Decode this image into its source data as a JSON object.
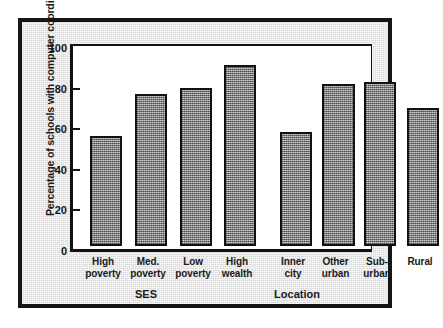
{
  "chart_data": {
    "type": "bar",
    "title": "",
    "xlabel": "",
    "ylabel": "Percentage of schools with computer coordinators",
    "ylim": [
      0,
      100
    ],
    "yticks": [
      0,
      20,
      40,
      60,
      80,
      100
    ],
    "ytick_labels": [
      "0",
      "20",
      "40",
      "60",
      "80",
      "100"
    ],
    "grid": false,
    "legend": false,
    "group_labels": [
      "SES",
      "Location"
    ],
    "categories": [
      "High poverty",
      "Med. poverty",
      "Low poverty",
      "High wealth",
      "Inner city",
      "Other urban",
      "Sub-urban",
      "Rural"
    ],
    "category_lines": [
      [
        "High",
        "poverty"
      ],
      [
        "Med.",
        "poverty"
      ],
      [
        "Low",
        "poverty"
      ],
      [
        "High",
        "wealth"
      ],
      [
        "Inner",
        "city"
      ],
      [
        "Other",
        "urban"
      ],
      [
        "Sub-",
        "urban"
      ],
      [
        "Rural",
        ""
      ]
    ],
    "values": [
      54,
      75,
      78,
      89,
      56,
      80,
      81,
      68
    ],
    "groups": [
      {
        "name": "SES",
        "categories": [
          "High poverty",
          "Med. poverty",
          "Low poverty",
          "High wealth"
        ],
        "values": [
          54,
          75,
          78,
          89
        ]
      },
      {
        "name": "Location",
        "categories": [
          "Inner city",
          "Other urban",
          "Sub-urban",
          "Rural"
        ],
        "values": [
          56,
          80,
          81,
          68
        ]
      }
    ],
    "colors": {
      "bar_fill": "#9a9a9a",
      "bar_edge": "#121212",
      "plot_background": "#ffffff",
      "figure_background": "#d9d9d9",
      "frame": "#151515",
      "text": "#1a1a1a"
    }
  },
  "axis": {
    "y_title": "Percentage of schools with computer coordinators",
    "ticks": [
      {
        "label": "100",
        "value": 100
      },
      {
        "label": "80",
        "value": 80
      },
      {
        "label": "60",
        "value": 60
      },
      {
        "label": "40",
        "value": 40
      },
      {
        "label": "20",
        "value": 20
      },
      {
        "label": "0",
        "value": 0
      }
    ]
  },
  "bars": [
    {
      "name": "high-poverty",
      "line1": "High",
      "line2": "poverty",
      "value": 54
    },
    {
      "name": "med-poverty",
      "line1": "Med.",
      "line2": "poverty",
      "value": 75
    },
    {
      "name": "low-poverty",
      "line1": "Low",
      "line2": "poverty",
      "value": 78
    },
    {
      "name": "high-wealth",
      "line1": "High",
      "line2": "wealth",
      "value": 89
    },
    {
      "name": "inner-city",
      "line1": "Inner",
      "line2": "city",
      "value": 56
    },
    {
      "name": "other-urban",
      "line1": "Other",
      "line2": "urban",
      "value": 80
    },
    {
      "name": "sub-urban",
      "line1": "Sub-",
      "line2": "urban",
      "value": 81
    },
    {
      "name": "rural",
      "line1": "Rural",
      "line2": "",
      "value": 68
    }
  ],
  "groups": {
    "ses": "SES",
    "location": "Location"
  }
}
